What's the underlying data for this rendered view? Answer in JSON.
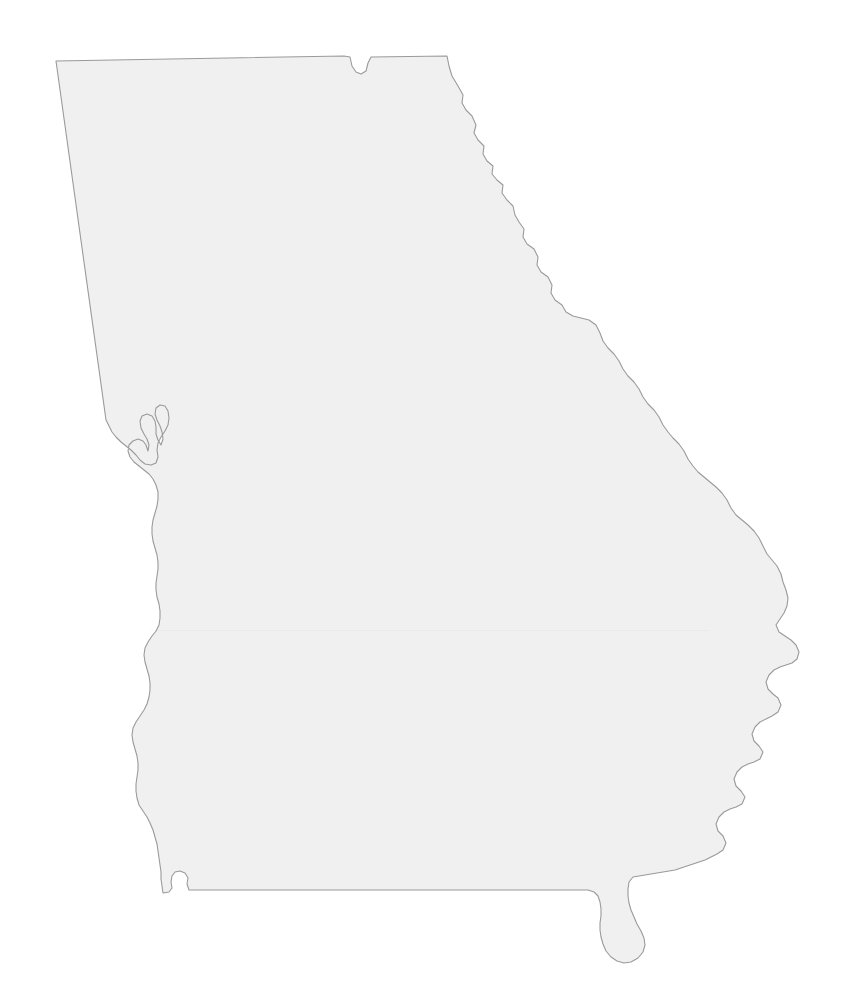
{
  "document": {
    "kind": "blank-outline-map",
    "subject": "State of Georgia, United States",
    "has_labels": false,
    "has_text": false,
    "width": 856,
    "height": 1000
  },
  "canvas": {
    "background_color": "#ffffff"
  },
  "map": {
    "name": "georgia-outline",
    "fill_color": "#f0f0f0",
    "stroke_color": "#9a9a9a",
    "stroke_width": 1.1,
    "viewbox": "0 0 856 1000",
    "regions": [
      {
        "name": "georgia-state-boundary",
        "label": "",
        "path": "M 56 61 L 344 56 L 350 57 L 352 66 L 356 72 L 361 74 L 366 71 L 368 63 L 371 57 L 447 56 L 449 66 L 452 76 L 458 86 L 463 95 L 462 103 L 466 110 L 472 116 L 476 125 L 474 133 L 478 140 L 484 146 L 483 154 L 487 161 L 493 166 L 492 174 L 497 180 L 503 185 L 502 193 L 507 200 L 513 206 L 515 215 L 519 222 L 524 229 L 523 237 L 527 244 L 534 249 L 538 257 L 537 265 L 541 272 L 548 277 L 552 285 L 551 293 L 555 300 L 562 305 L 566 312 L 573 316 L 581 318 L 589 320 L 596 325 L 600 333 L 603 341 L 608 348 L 614 354 L 619 361 L 623 369 L 628 376 L 634 382 L 639 389 L 643 397 L 648 404 L 654 410 L 659 417 L 663 425 L 668 432 L 673 438 L 679 444 L 684 451 L 688 459 L 693 466 L 698 472 L 704 477 L 710 482 L 716 487 L 722 493 L 727 500 L 731 508 L 736 515 L 742 520 L 748 525 L 754 531 L 759 538 L 763 546 L 767 554 L 772 560 L 777 566 L 781 574 L 783 582 L 786 590 L 788 598 L 787 606 L 784 613 L 780 619 L 776 625 L 779 632 L 785 636 L 791 640 L 796 645 L 799 652 L 797 659 L 792 663 L 786 665 L 780 667 L 774 670 L 769 675 L 766 682 L 768 689 L 773 694 L 778 698 L 781 705 L 778 712 L 772 716 L 766 719 L 760 722 L 755 727 L 752 734 L 754 741 L 759 746 L 763 752 L 760 759 L 754 762 L 748 764 L 742 767 L 737 772 L 734 779 L 736 786 L 741 791 L 745 797 L 742 804 L 736 807 L 730 809 L 724 812 L 719 817 L 716 824 L 718 831 L 723 836 L 726 843 L 723 850 L 717 854 L 711 857 L 705 860 L 699 862 L 693 864 L 687 866 L 681 868 L 675 870 L 669 871 L 663 872 L 657 873 L 651 874 L 645 875 L 639 876 L 633 877 L 629 882 L 628 889 L 628 896 L 629 903 L 631 910 L 634 917 L 637 924 L 641 931 L 644 938 L 645 945 L 643 952 L 638 958 L 631 962 L 624 963 L 617 961 L 611 957 L 606 951 L 603 944 L 601 937 L 600 930 L 600 923 L 601 916 L 601 909 L 600 902 L 598 896 L 594 892 L 588 890 L 581 890 L 574 890 L 567 890 L 560 890 L 553 890 L 546 890 L 539 890 L 532 890 L 525 890 L 518 890 L 511 890 L 504 890 L 497 890 L 490 890 L 483 890 L 476 890 L 469 890 L 462 890 L 455 890 L 448 890 L 441 890 L 434 890 L 427 890 L 420 890 L 413 890 L 406 890 L 399 890 L 392 890 L 385 890 L 378 890 L 371 890 L 364 890 L 357 890 L 350 890 L 343 890 L 336 890 L 329 890 L 322 890 L 315 890 L 308 890 L 301 890 L 294 890 L 287 890 L 280 890 L 273 890 L 266 890 L 259 890 L 252 890 L 245 890 L 238 890 L 231 890 L 224 890 L 217 890 L 210 890 L 203 890 L 196 890 L 189 890 L 187 884 L 188 878 L 185 873 L 180 871 L 175 872 L 172 876 L 171 882 L 172 888 L 169 892 L 163 893 L 162 886 L 161 879 L 161 872 L 160 865 L 159 858 L 158 851 L 157 844 L 155 837 L 153 830 L 150 823 L 147 817 L 143 811 L 139 805 L 137 798 L 136 791 L 136 784 L 137 777 L 138 770 L 138 763 L 137 756 L 135 749 L 133 742 L 132 735 L 133 728 L 136 722 L 140 716 L 144 710 L 147 704 L 149 697 L 150 690 L 150 683 L 149 676 L 147 669 L 145 662 L 144 655 L 145 648 L 148 642 L 152 636 L 156 631 L 159 625 L 160 618 L 160 611 L 159 604 L 157 597 L 156 590 L 156 583 L 157 576 L 158 569 L 158 562 L 157 555 L 155 548 L 153 541 L 152 534 L 152 527 L 153 520 L 155 513 L 157 506 L 158 499 L 158 492 L 156 485 L 153 479 L 149 474 L 144 470 L 139 466 L 134 462 L 130 457 L 128 451 L 129 445 L 133 441 L 138 439 L 143 441 L 146 445 L 148 451 L 149 445 L 147 439 L 144 434 L 141 428 L 140 421 L 142 416 L 147 414 L 152 416 L 155 421 L 156 427 L 156 434 L 158 440 L 161 445 L 163 439 L 162 432 L 160 426 L 157 420 L 155 414 L 156 408 L 160 405 L 165 406 L 168 411 L 169 418 L 168 425 L 165 431 L 161 437 L 158 443 L 157 450 L 158 457 L 156 463 L 151 465 L 145 464 L 140 460 L 136 455 L 131 450 L 126 446 L 121 442 L 116 437 L 112 432 L 109 426 L 106 420 L 56 61 Z"
      }
    ]
  }
}
